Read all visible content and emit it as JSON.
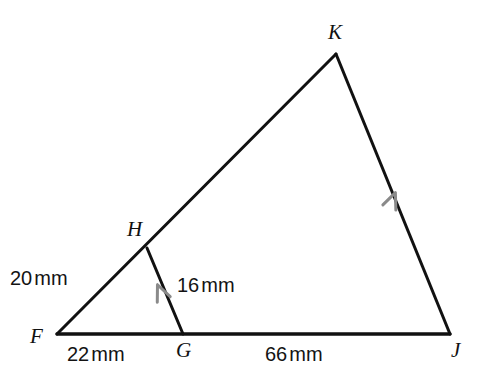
{
  "figure": {
    "kind": "geometry-diagram",
    "background_color": "#ffffff",
    "stroke_color": "#111111",
    "tick_color": "#8a8a8a",
    "vertices": [
      {
        "name": "K",
        "label": "K",
        "x": 336,
        "y": 54
      },
      {
        "name": "H",
        "label": "H",
        "x": 147,
        "y": 248
      },
      {
        "name": "F",
        "label": "F",
        "x": 57,
        "y": 334
      },
      {
        "name": "G",
        "label": "G",
        "x": 183,
        "y": 334
      },
      {
        "name": "J",
        "label": "J",
        "x": 450,
        "y": 334
      }
    ],
    "segments": [
      {
        "name": "side-FK",
        "from": "F",
        "to": "K"
      },
      {
        "name": "side-KJ",
        "from": "K",
        "to": "J"
      },
      {
        "name": "side-FJ",
        "from": "F",
        "to": "J"
      },
      {
        "name": "segment-HG",
        "from": "H",
        "to": "G"
      }
    ],
    "parallel_marks": [
      {
        "name": "parallel-mark-HG",
        "on": "segment-HG",
        "x": 161,
        "y": 293
      },
      {
        "name": "parallel-mark-KJ",
        "on": "side-KJ",
        "x": 392,
        "y": 201
      }
    ],
    "measurements": [
      {
        "name": "length-FH",
        "segment": "FH",
        "value": "20",
        "unit": "mm"
      },
      {
        "name": "length-HG",
        "segment": "HG",
        "value": "16",
        "unit": "mm"
      },
      {
        "name": "length-FG",
        "segment": "FG",
        "value": "22",
        "unit": "mm"
      },
      {
        "name": "length-GJ",
        "segment": "GJ",
        "value": "66",
        "unit": "mm"
      }
    ]
  }
}
